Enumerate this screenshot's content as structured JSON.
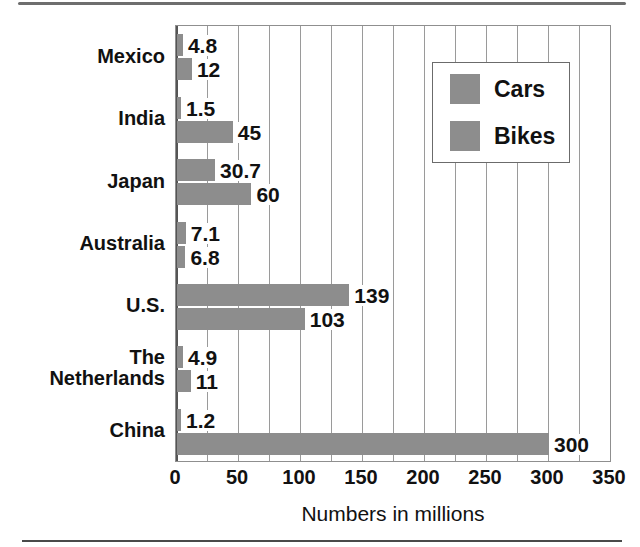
{
  "chart_data": {
    "type": "bar",
    "orientation": "horizontal",
    "title": "",
    "xlabel": "Numbers in millions",
    "ylabel": "",
    "xlim": [
      0,
      350
    ],
    "xticks": [
      0,
      50,
      100,
      150,
      200,
      250,
      300,
      350
    ],
    "grid": "vertical minor gridlines every 25",
    "legend_position": "upper right inside plot",
    "categories": [
      "Mexico",
      "India",
      "Japan",
      "Australia",
      "U.S.",
      "The Netherlands",
      "China"
    ],
    "category_labels": [
      [
        "Mexico"
      ],
      [
        "India"
      ],
      [
        "Japan"
      ],
      [
        "Australia"
      ],
      [
        "U.S."
      ],
      [
        "The",
        "Netherlands"
      ],
      [
        "China"
      ]
    ],
    "series": [
      {
        "name": "Cars",
        "color": "#8d8d8d",
        "values": [
          4.8,
          1.5,
          30.7,
          7.1,
          139,
          4.9,
          1.2
        ],
        "value_labels": [
          "4.8",
          "1.5",
          "30.7",
          "7.1",
          "139",
          "4.9",
          "1.2"
        ]
      },
      {
        "name": "Bikes",
        "color": "#8d8d8d",
        "values": [
          12,
          45,
          60,
          6.8,
          103,
          11,
          300
        ],
        "value_labels": [
          "12",
          "45",
          "60",
          "6.8",
          "103",
          "11",
          "300"
        ]
      }
    ]
  },
  "legend": {
    "items": [
      {
        "label": "Cars",
        "color": "#8d8d8d"
      },
      {
        "label": "Bikes",
        "color": "#8d8d8d"
      }
    ]
  },
  "axis": {
    "x_tick_labels": [
      "0",
      "50",
      "100",
      "150",
      "200",
      "250",
      "300",
      "350"
    ],
    "x_axis_title": "Numbers in millions"
  },
  "colors": {
    "bar": "#8d8d8d",
    "gridline": "#9a9a9a",
    "axis": "#555555",
    "text": "#111111",
    "background": "#ffffff",
    "rule": "#6e6e6e"
  }
}
